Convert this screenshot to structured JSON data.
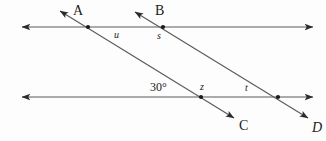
{
  "figure": {
    "type": "geometry-diagram",
    "background_color": "#fdfdfd",
    "line_color": "#5a5a5a",
    "label_color": "#1b1b1b",
    "width": 326,
    "height": 141
  },
  "labels": {
    "point_a": "A",
    "point_b": "B",
    "point_c": "C",
    "point_d": "D",
    "angle_u": "u",
    "angle_s": "s",
    "angle_z": "z",
    "angle_t": "t",
    "angle_30": "30°"
  },
  "geometry": {
    "horizontal_lines": [
      {
        "name": "upper-horizontal-line",
        "x1": 22,
        "y1": 27,
        "x2": 313,
        "y2": 27,
        "arrows": "both"
      },
      {
        "name": "lower-horizontal-line",
        "x1": 22,
        "y1": 97,
        "x2": 313,
        "y2": 97,
        "arrows": "both"
      }
    ],
    "slanted_lines": [
      {
        "name": "line-a-c",
        "x1": 60,
        "y1": 11,
        "x2": 234,
        "y2": 118,
        "arrows": "both",
        "start_label": "A",
        "end_label": "C"
      },
      {
        "name": "line-b-d",
        "x1": 135,
        "y1": 12,
        "x2": 308,
        "y2": 118,
        "arrows": "both",
        "start_label": "B",
        "end_label": "D"
      }
    ],
    "intersections": [
      {
        "name": "intersection-a-upper",
        "x": 88,
        "y": 27
      },
      {
        "name": "intersection-b-upper",
        "x": 163,
        "y": 27
      },
      {
        "name": "intersection-a-lower",
        "x": 201,
        "y": 97
      },
      {
        "name": "intersection-b-lower",
        "x": 278,
        "y": 97
      }
    ]
  }
}
